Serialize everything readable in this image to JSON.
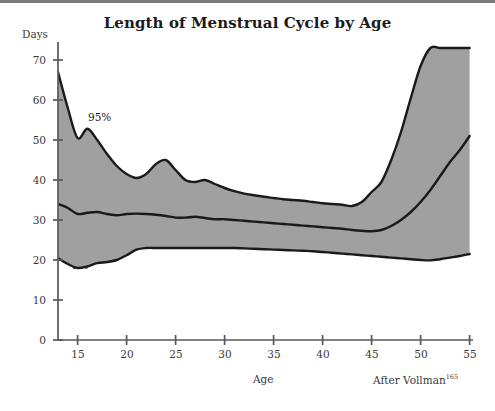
{
  "figure": {
    "title": "Length of Menstrual Cycle by Age",
    "y_axis_title": "Days",
    "x_axis_title": "Age",
    "attribution_text": "After Vollman",
    "attribution_superscript": "165",
    "series_labels": {
      "upper": "95%",
      "mean": "Mean",
      "lower": "5%"
    },
    "colors": {
      "band_fill": "#a0a0a0",
      "curve_stroke": "#1a1a1a",
      "axis": "#58595b",
      "text": "#3a3a3a",
      "title": "#1b1b1b",
      "background": "#ffffff",
      "top_rule": "#7b7b7b"
    }
  },
  "chart_data": {
    "type": "line",
    "title": "Length of Menstrual Cycle by Age",
    "xlabel": "Age",
    "ylabel": "Days",
    "xlim": [
      13,
      55
    ],
    "ylim": [
      0,
      73
    ],
    "grid": false,
    "legend_position": "inline-annotations",
    "annotations": [
      {
        "text": "95%",
        "x": 16.4,
        "y": 57.5
      },
      {
        "text": "Mean",
        "x": 19.0,
        "y": 35.0
      },
      {
        "text": "5%",
        "x": 16.2,
        "y": 16.0
      },
      {
        "text": "After Vollman165",
        "x": 51,
        "y": -8
      }
    ],
    "xticks": [
      15,
      20,
      25,
      30,
      35,
      40,
      45,
      50,
      55
    ],
    "yticks": [
      0,
      10,
      20,
      30,
      40,
      50,
      60,
      70
    ],
    "x": [
      13,
      14,
      15,
      16,
      17,
      18,
      19,
      20,
      21,
      22,
      23,
      24,
      25,
      26,
      27,
      28,
      29,
      30,
      31,
      32,
      33,
      34,
      35,
      36,
      37,
      38,
      39,
      40,
      41,
      42,
      43,
      44,
      45,
      46,
      47,
      48,
      49,
      50,
      51,
      52,
      53,
      54,
      55
    ],
    "series": [
      {
        "name": "95%",
        "values": [
          67.0,
          58.0,
          50.5,
          52.8,
          50.0,
          46.5,
          43.5,
          41.5,
          40.5,
          41.5,
          44.0,
          45.0,
          42.5,
          40.0,
          39.5,
          40.0,
          39.0,
          38.0,
          37.2,
          36.6,
          36.2,
          35.8,
          35.5,
          35.2,
          35.0,
          34.8,
          34.5,
          34.2,
          34.0,
          33.8,
          33.5,
          34.5,
          37.0,
          39.5,
          45.0,
          52.0,
          60.5,
          68.5,
          73.0,
          73.0,
          73.0,
          73.0,
          73.0
        ]
      },
      {
        "name": "Mean",
        "values": [
          34.0,
          33.0,
          31.5,
          31.8,
          32.0,
          31.5,
          31.2,
          31.5,
          31.6,
          31.5,
          31.3,
          31.0,
          30.6,
          30.6,
          30.8,
          30.5,
          30.2,
          30.2,
          30.0,
          29.8,
          29.6,
          29.4,
          29.2,
          29.0,
          28.8,
          28.6,
          28.4,
          28.2,
          28.0,
          27.8,
          27.5,
          27.3,
          27.2,
          27.5,
          28.5,
          30.0,
          32.0,
          34.5,
          37.5,
          41.0,
          44.5,
          47.5,
          51.0
        ]
      },
      {
        "name": "5%",
        "values": [
          20.5,
          19.0,
          18.0,
          18.4,
          19.2,
          19.5,
          20.0,
          21.2,
          22.6,
          23.0,
          23.0,
          23.0,
          23.0,
          23.0,
          23.0,
          23.0,
          23.0,
          23.0,
          23.0,
          22.9,
          22.8,
          22.7,
          22.6,
          22.5,
          22.4,
          22.3,
          22.2,
          22.0,
          21.8,
          21.6,
          21.4,
          21.2,
          21.0,
          20.8,
          20.6,
          20.4,
          20.2,
          20.0,
          19.9,
          20.2,
          20.6,
          21.0,
          21.5
        ]
      }
    ]
  },
  "ticks": {
    "y": [
      "70",
      "60",
      "50",
      "40",
      "30",
      "20",
      "10",
      "0"
    ],
    "x": [
      "15",
      "20",
      "25",
      "30",
      "35",
      "40",
      "45",
      "50",
      "55"
    ]
  }
}
